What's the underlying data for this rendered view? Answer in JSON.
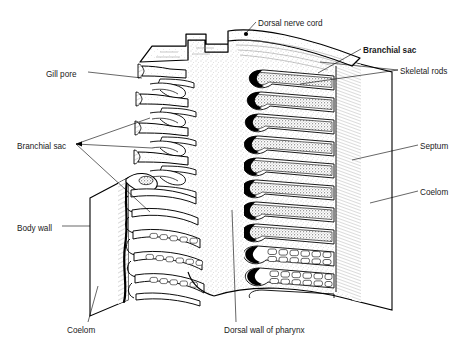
{
  "figure": {
    "background_color": "#ffffff",
    "ink_color": "#000000",
    "stipple_color": "#8a8a8a"
  },
  "labels": [
    {
      "id": "dorsal-nerve-cord",
      "text": "Dorsal nerve cord",
      "x": 258,
      "y": 23,
      "anchor": "start"
    },
    {
      "id": "branchial-sac-right",
      "text": "Branchial sac",
      "x": 363,
      "y": 50,
      "anchor": "start"
    },
    {
      "id": "skeletal-rods",
      "text": "Skeletal rods",
      "x": 400,
      "y": 71,
      "anchor": "start"
    },
    {
      "id": "gill-pore",
      "text": "Gill pore",
      "x": 46,
      "y": 74,
      "anchor": "start"
    },
    {
      "id": "branchial-sac-left",
      "text": "Branchial sac",
      "x": 17,
      "y": 146,
      "anchor": "start"
    },
    {
      "id": "septum",
      "text": "Septum",
      "x": 420,
      "y": 146,
      "anchor": "start"
    },
    {
      "id": "coelom-right",
      "text": "Coelom",
      "x": 420,
      "y": 192,
      "anchor": "start"
    },
    {
      "id": "body-wall",
      "text": "Body wall",
      "x": 17,
      "y": 228,
      "anchor": "start"
    },
    {
      "id": "coelom-bottom",
      "text": "Coelom",
      "x": 67,
      "y": 330,
      "anchor": "start"
    },
    {
      "id": "dorsal-wall-of-pharynx",
      "text": "Dorsal wall of pharynx",
      "x": 224,
      "y": 330,
      "anchor": "start"
    }
  ],
  "structures": {
    "gill_bars_right_count": 10,
    "gill_bars_right_with_synapticles": 2,
    "gill_pores_left_count": 4,
    "gill_loops_lower_left_count": 5,
    "nerve_cord_dot": {
      "x": 246,
      "y": 34
    }
  }
}
